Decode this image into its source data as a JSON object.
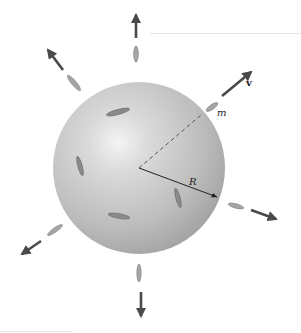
{
  "figure": {
    "labels": {
      "velocity": "v",
      "mass": "m",
      "radius": "R"
    },
    "colors": {
      "sphere_light": "#f2f2f2",
      "sphere_mid": "#c4c4c4",
      "sphere_dark": "#9a9a9a",
      "arrow": "#4a4a4a",
      "molecule": "#8a8a8a"
    }
  }
}
